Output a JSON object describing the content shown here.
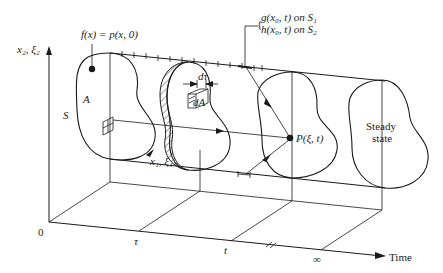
{
  "diagram": {
    "axes": {
      "vertical_label": "x₂, ξ₂",
      "depth_label": "x₁, ξ₁",
      "time_label": "Time",
      "origin_label": "0",
      "time_ticks": [
        "τ",
        "t",
        "∞"
      ]
    },
    "labels": {
      "initial_condition": "f(x) = p(x, 0)",
      "boundary_g": "g(x₀, t) on S₁",
      "boundary_h": "h(x₀, t) on S₂",
      "region": "A",
      "surface": "S",
      "d_tau": "dτ",
      "d_area": "dA",
      "point": "P(ξ, t)",
      "steady_line1": "Steady",
      "steady_line2": "state"
    },
    "colors": {
      "ink": "#1a1a1a",
      "background": "#ffffff"
    }
  }
}
